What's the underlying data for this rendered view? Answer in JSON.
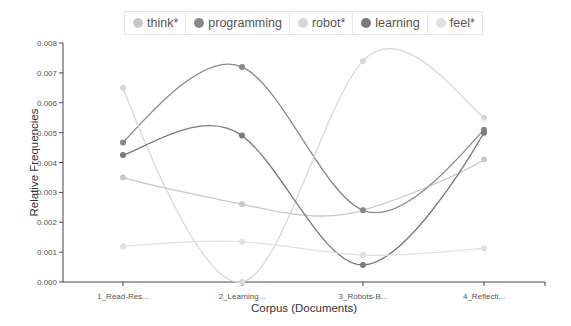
{
  "chart_data": {
    "type": "line",
    "title": "",
    "xlabel": "Corpus (Documents)",
    "ylabel": "Relative Frequencies",
    "categories": [
      "1_Read-Res...",
      "2_Learning...",
      "3_Robots-B...",
      "4_Reflecti..."
    ],
    "ylim": [
      0,
      0.008
    ],
    "yticks": [
      "0.000",
      "0.001",
      "0.002",
      "0.003",
      "0.004",
      "0.005",
      "0.006",
      "0.007",
      "0.008"
    ],
    "grid": false,
    "legend_position": "top",
    "series": [
      {
        "name": "think*",
        "color": "#c8c8c8",
        "values": [
          0.0035,
          0.0026,
          0.0024,
          0.0041
        ]
      },
      {
        "name": "programming",
        "color": "#888888",
        "values": [
          0.00467,
          0.0072,
          0.0024,
          0.0051
        ]
      },
      {
        "name": "robot*",
        "color": "#d8d8d8",
        "values": [
          0.0065,
          0.0,
          0.0074,
          0.0055
        ]
      },
      {
        "name": "learning",
        "color": "#7a7a7a",
        "values": [
          0.00425,
          0.0049,
          0.00057,
          0.005
        ]
      },
      {
        "name": "feel*",
        "color": "#e0e0e0",
        "values": [
          0.0012,
          0.00135,
          0.0009,
          0.00113
        ]
      }
    ]
  },
  "legend": {
    "items": [
      {
        "label": "think*",
        "color": "#c8c8c8"
      },
      {
        "label": "programming",
        "color": "#888888"
      },
      {
        "label": "robot*",
        "color": "#d8d8d8"
      },
      {
        "label": "learning",
        "color": "#7a7a7a"
      },
      {
        "label": "feel*",
        "color": "#e0e0e0"
      }
    ]
  }
}
